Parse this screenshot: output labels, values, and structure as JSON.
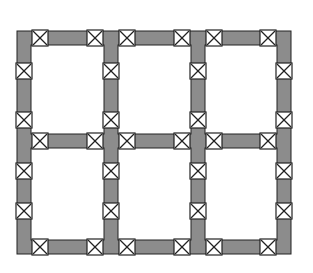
{
  "diagram": {
    "type": "structural-frame-plan",
    "colors": {
      "background": "#ffffff",
      "beam_fill": "#8c8c8c",
      "outline": "#222222",
      "connector_fill": "#ffffff",
      "bay_fill": "#ffffff"
    },
    "grid": {
      "columns": 3,
      "rows": 2,
      "frame": {
        "x": 17,
        "y": 31,
        "width": 274,
        "height": 223
      },
      "member_thickness": 14,
      "vertical_members_x": [
        17,
        104,
        191,
        277
      ],
      "horizontal_members_y": [
        31,
        134,
        240
      ]
    },
    "connectors": {
      "size": 16,
      "glyph": "x-box",
      "horizontal_offsets_in_bay": [
        15,
        70
      ],
      "vertical_offsets_top_row": [
        26,
        75
      ],
      "vertical_offsets_bottom_row": [
        23,
        63
      ]
    }
  }
}
